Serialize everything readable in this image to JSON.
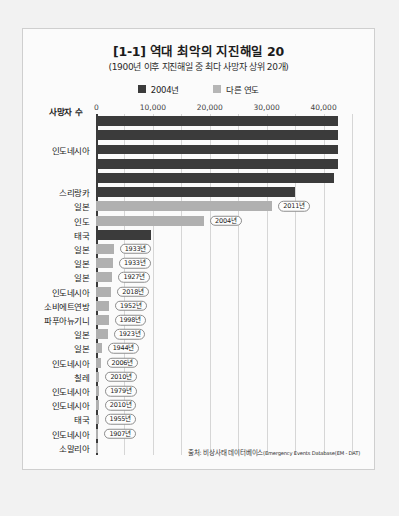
{
  "card": {
    "title": "[1-1] 역대 최악의 지진해일 20",
    "subtitle": "(1900년 이후 지진해일 중 최다 사망자 상위 20개)",
    "axis_label": "사망자 수",
    "source_prefix": "출처: 비상사태 데이터베이스",
    "source_en": "(Emergency Events Database(EM - DAT)"
  },
  "legend": [
    {
      "label": "2004년",
      "color": "#3b3b3b",
      "key": "y2004"
    },
    {
      "label": "다른 연도",
      "color": "#b6b6b6",
      "key": "other"
    }
  ],
  "chart_data": {
    "type": "bar",
    "orientation": "horizontal",
    "title": "[1-1] 역대 최악의 지진해일 20",
    "subtitle": "(1900년 이후 지진해일 중 최다 사망자 상위 20개)",
    "xlabel": "사망자 수",
    "ylabel": "",
    "xlim": [
      0,
      45000
    ],
    "xticks": [
      0,
      10000,
      20000,
      30000,
      40000
    ],
    "xticklabels": [
      "0",
      "10,000",
      "20,000",
      "30,000",
      "40,000"
    ],
    "grid": true,
    "legend_position": "top-center",
    "series": [
      {
        "name": "2004년",
        "color": "#3b3b3b"
      },
      {
        "name": "다른 연도",
        "color": "#b0b0b0"
      }
    ],
    "categories": [
      "",
      "",
      "인도네시아",
      "",
      "",
      "스리랑카",
      "일본",
      "인도",
      "태국",
      "일본",
      "일본",
      "일본",
      "인도네시아",
      "소비에트연방",
      "파푸아뉴기니",
      "일본",
      "일본",
      "인도네시아",
      "칠레",
      "인도네시아",
      "인도네시아",
      "태국",
      "인도네시아",
      "소말리아"
    ],
    "bars": [
      {
        "label": "",
        "value": 42500,
        "group": "2004년",
        "year": ""
      },
      {
        "label": "",
        "value": 42500,
        "group": "2004년",
        "year": ""
      },
      {
        "label": "인도네시아",
        "value": 42500,
        "group": "2004년",
        "year": ""
      },
      {
        "label": "",
        "value": 42500,
        "group": "2004년",
        "year": ""
      },
      {
        "label": "",
        "value": 41800,
        "group": "2004년",
        "year": ""
      },
      {
        "label": "스리랑카",
        "value": 35000,
        "group": "2004년",
        "year": ""
      },
      {
        "label": "일본",
        "value": 31000,
        "group": "다른 연도",
        "year": "2011년"
      },
      {
        "label": "인도",
        "value": 19000,
        "group": "다른 연도",
        "year": "2004년"
      },
      {
        "label": "태국",
        "value": 9600,
        "group": "2004년",
        "year": ""
      },
      {
        "label": "일본",
        "value": 3100,
        "group": "다른 연도",
        "year": "1933년"
      },
      {
        "label": "일본",
        "value": 3000,
        "group": "다른 연도",
        "year": "1933년"
      },
      {
        "label": "일본",
        "value": 2900,
        "group": "다른 연도",
        "year": "1927년"
      },
      {
        "label": "인도네시아",
        "value": 2700,
        "group": "다른 연도",
        "year": "2018년"
      },
      {
        "label": "소비에트연방",
        "value": 2300,
        "group": "다른 연도",
        "year": "1952년"
      },
      {
        "label": "파푸아뉴기니",
        "value": 2200,
        "group": "다른 연도",
        "year": "1998년"
      },
      {
        "label": "일본",
        "value": 2100,
        "group": "다른 연도",
        "year": "1923년"
      },
      {
        "label": "일본",
        "value": 1000,
        "group": "다른 연도",
        "year": "1944년"
      },
      {
        "label": "인도네시아",
        "value": 800,
        "group": "다른 연도",
        "year": "2006년"
      },
      {
        "label": "칠레",
        "value": 600,
        "group": "다른 연도",
        "year": "2010년"
      },
      {
        "label": "인도네시아",
        "value": 550,
        "group": "다른 연도",
        "year": "1979년"
      },
      {
        "label": "인도네시아",
        "value": 500,
        "group": "다른 연도",
        "year": "2010년"
      },
      {
        "label": "태국",
        "value": 450,
        "group": "다른 연도",
        "year": "1955년"
      },
      {
        "label": "인도네시아",
        "value": 420,
        "group": "다른 연도",
        "year": "1907년"
      },
      {
        "label": "소말리아",
        "value": 300,
        "group": "다른 연도",
        "year": ""
      }
    ]
  }
}
